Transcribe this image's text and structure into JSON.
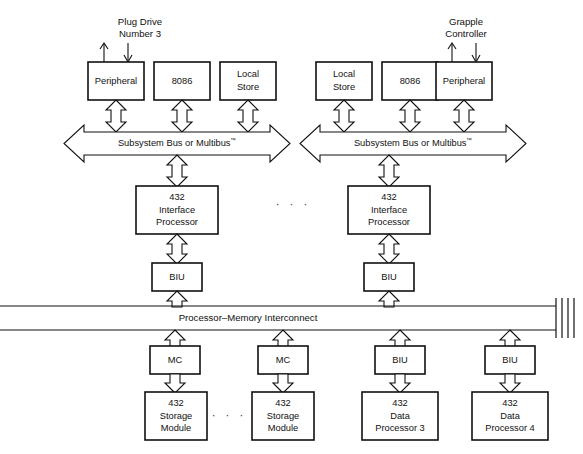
{
  "diagram": {
    "colors": {
      "background": "#ffffff",
      "stroke": "#111111",
      "ellipsis": "#555555"
    },
    "external_labels": [
      {
        "id": "plug-drive",
        "line1": "Plug Drive",
        "line2": "Number 3",
        "x": 140,
        "y": 22
      },
      {
        "id": "grapple-controller",
        "line1": "Grapple",
        "line2": "Controller",
        "x": 466,
        "y": 22
      }
    ],
    "subsystems": [
      {
        "id": "left-subsystem",
        "bus_label": "Subsystem Bus or Multibus",
        "bus_trademark": "™",
        "modules": [
          {
            "id": "left-peripheral",
            "lines": [
              "Peripheral"
            ]
          },
          {
            "id": "left-8086",
            "lines": [
              "8086"
            ]
          },
          {
            "id": "left-local-store",
            "lines": [
              "Local",
              "Store"
            ]
          }
        ],
        "interface_processor": {
          "id": "left-ip",
          "lines": [
            "432",
            "Interface",
            "Processor"
          ]
        },
        "biu": {
          "id": "left-biu",
          "lines": [
            "BIU"
          ]
        }
      },
      {
        "id": "right-subsystem",
        "bus_label": "Subsystem Bus or Multibus",
        "bus_trademark": "™",
        "modules": [
          {
            "id": "right-local-store",
            "lines": [
              "Local",
              "Store"
            ]
          },
          {
            "id": "right-8086",
            "lines": [
              "8086"
            ]
          },
          {
            "id": "right-peripheral",
            "lines": [
              "Peripheral"
            ]
          }
        ],
        "interface_processor": {
          "id": "right-ip",
          "lines": [
            "432",
            "Interface",
            "Processor"
          ]
        },
        "biu": {
          "id": "right-biu",
          "lines": [
            "BIU"
          ]
        }
      }
    ],
    "interconnect": {
      "id": "processor-memory-interconnect",
      "label": "Processor–Memory Interconnect"
    },
    "bottom_columns": [
      {
        "id": "col-storage-1",
        "controller": {
          "id": "mc-1",
          "lines": [
            "MC"
          ]
        },
        "unit": {
          "id": "storage-module-1",
          "lines": [
            "432",
            "Storage",
            "Module"
          ]
        }
      },
      {
        "id": "col-storage-2",
        "controller": {
          "id": "mc-2",
          "lines": [
            "MC"
          ]
        },
        "unit": {
          "id": "storage-module-2",
          "lines": [
            "432",
            "Storage",
            "Module"
          ]
        }
      },
      {
        "id": "col-data-proc-3",
        "controller": {
          "id": "biu-3",
          "lines": [
            "BIU"
          ]
        },
        "unit": {
          "id": "data-processor-3",
          "lines": [
            "432",
            "Data",
            "Processor 3"
          ]
        }
      },
      {
        "id": "col-data-proc-4",
        "controller": {
          "id": "biu-4",
          "lines": [
            "BIU"
          ]
        },
        "unit": {
          "id": "data-processor-4",
          "lines": [
            "432",
            "Data",
            "Processor 4"
          ]
        }
      }
    ],
    "ellipses": [
      {
        "id": "ellipsis-subsystems",
        "text": "· · ·",
        "x": 293,
        "y": 205
      },
      {
        "id": "ellipsis-storage",
        "text": "· · ·",
        "x": 229,
        "y": 405
      }
    ]
  }
}
